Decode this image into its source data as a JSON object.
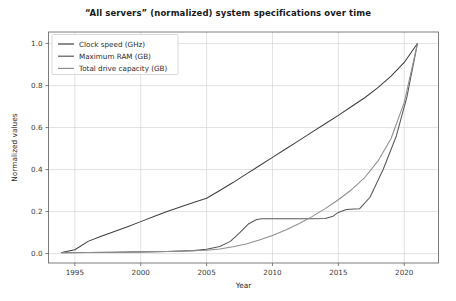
{
  "chart_data": {
    "type": "line",
    "title": "“All servers” (normalized) system specifications over time",
    "xlabel": "Year",
    "ylabel": "Normalized values",
    "xlim": [
      1993.0,
      2022.6
    ],
    "ylim": [
      -0.045,
      1.055
    ],
    "xticks": [
      1995,
      2000,
      2005,
      2010,
      2015,
      2020
    ],
    "xticklabels": [
      "1995",
      "2000",
      "2005",
      "2010",
      "2015",
      "2020"
    ],
    "yticks": [
      0.0,
      0.2,
      0.4,
      0.6,
      0.8,
      1.0
    ],
    "yticklabels": [
      "0.0",
      "0.2",
      "0.4",
      "0.6",
      "0.8",
      "1.0"
    ],
    "grid": true,
    "legend_position": "upper left",
    "series": [
      {
        "name": "Clock speed (GHz)",
        "color": "#3f3f3f",
        "x": [
          1994.0,
          1995.0,
          1996.0,
          1997.0,
          1998.0,
          1999.0,
          2000.0,
          2001.0,
          2002.0,
          2003.0,
          2004.0,
          2005.0,
          2006.0,
          2007.0,
          2008.0,
          2009.0,
          2010.0,
          2011.0,
          2012.0,
          2013.0,
          2014.0,
          2015.0,
          2016.0,
          2017.0,
          2018.0,
          2019.0,
          2020.0,
          2021.0
        ],
        "y": [
          0.005,
          0.018,
          0.058,
          0.082,
          0.105,
          0.128,
          0.152,
          0.176,
          0.2,
          0.222,
          0.243,
          0.263,
          0.3,
          0.338,
          0.378,
          0.418,
          0.458,
          0.498,
          0.538,
          0.578,
          0.618,
          0.658,
          0.7,
          0.742,
          0.79,
          0.845,
          0.91,
          1.0
        ]
      },
      {
        "name": "Maximum RAM (GB)",
        "color": "#575757",
        "x": [
          1994.0,
          1996.0,
          1998.0,
          2000.0,
          2002.0,
          2004.0,
          2005.0,
          2006.0,
          2006.8,
          2007.5,
          2008.2,
          2008.8,
          2009.2,
          2011.0,
          2013.0,
          2014.0,
          2014.6,
          2015.0,
          2015.6,
          2016.2,
          2016.6,
          2017.4,
          2018.4,
          2019.4,
          2020.2,
          2021.0
        ],
        "y": [
          0.004,
          0.005,
          0.006,
          0.008,
          0.01,
          0.014,
          0.02,
          0.034,
          0.058,
          0.098,
          0.142,
          0.162,
          0.166,
          0.166,
          0.166,
          0.167,
          0.178,
          0.196,
          0.21,
          0.212,
          0.213,
          0.268,
          0.4,
          0.56,
          0.745,
          1.0
        ]
      },
      {
        "name": "Total drive capacity (GB)",
        "color": "#8f8f8f",
        "x": [
          1994.0,
          1996.0,
          1998.0,
          2000.0,
          2002.0,
          2004.0,
          2005.0,
          2006.0,
          2007.0,
          2008.0,
          2009.0,
          2010.0,
          2011.0,
          2012.0,
          2013.0,
          2014.0,
          2015.0,
          2016.0,
          2017.0,
          2018.0,
          2019.0,
          2020.0,
          2021.0
        ],
        "y": [
          0.004,
          0.005,
          0.006,
          0.008,
          0.01,
          0.013,
          0.016,
          0.022,
          0.032,
          0.046,
          0.064,
          0.086,
          0.112,
          0.142,
          0.176,
          0.214,
          0.256,
          0.304,
          0.362,
          0.44,
          0.548,
          0.72,
          1.0
        ]
      }
    ]
  }
}
